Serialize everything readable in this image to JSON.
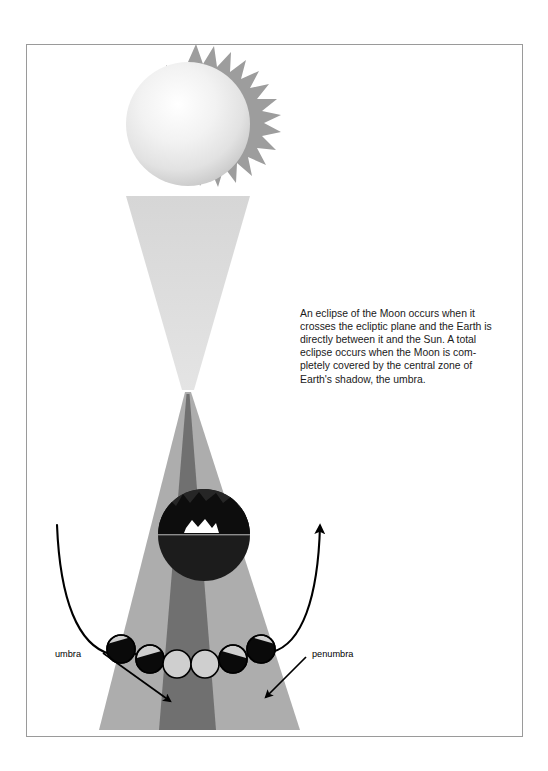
{
  "figure": {
    "name": "lunar-eclipse-diagram",
    "frame": {
      "border_color": "#9a9a9a",
      "background": "#ffffff"
    },
    "colors": {
      "sun_core": "#ffffff",
      "sun_edge": "#cfcfcf",
      "sun_corona": "#9d9d9d",
      "light_cone": "#dcdcdc",
      "penumbra": "#adadad",
      "umbra": "#707070",
      "earth_dark": "#1c1c1c",
      "earth_cloud": "#ffffff",
      "line": "#000000",
      "text": "#1a1a1a"
    },
    "sun": {
      "name": "sun",
      "label": "Sun"
    },
    "earth": {
      "name": "earth",
      "label": "Earth"
    },
    "caption": {
      "lines": [
        "An eclipse of the Moon occurs when it",
        "crosses the ecliptic plane and the Earth is",
        "directly between it and the Sun. A total",
        "eclipse occurs when the Moon is com-",
        "pletely covered by the central zone of",
        "Earth's shadow, the umbra."
      ],
      "full_text": "An eclipse of the Moon occurs when it crosses the ecliptic plane and the Earth is directly between it and the Sun. A total eclipse occurs when the Moon is completely covered by the central zone of Earth's shadow, the umbra."
    },
    "annotations": [
      {
        "name": "umbra-label",
        "text": "umbra",
        "x": 55,
        "y": 657
      },
      {
        "name": "penumbra-label",
        "text": "penumbra",
        "x": 312,
        "y": 657
      }
    ],
    "moon_phases": [
      {
        "name": "moon-1",
        "cx": 121,
        "cy": 649,
        "r": 14,
        "lit": "right-crescent",
        "shadow_fraction": 0.62
      },
      {
        "name": "moon-2",
        "cx": 150,
        "cy": 659,
        "r": 14,
        "lit": "right-half",
        "shadow_fraction": 0.45
      },
      {
        "name": "moon-3",
        "cx": 177,
        "cy": 664,
        "r": 14,
        "lit": "full",
        "shadow_fraction": 0.0
      },
      {
        "name": "moon-4",
        "cx": 205,
        "cy": 664,
        "r": 14,
        "lit": "full",
        "shadow_fraction": 0.0
      },
      {
        "name": "moon-5",
        "cx": 233,
        "cy": 659,
        "r": 14,
        "lit": "left-half",
        "shadow_fraction": 0.45
      },
      {
        "name": "moon-6",
        "cx": 261,
        "cy": 649,
        "r": 14,
        "lit": "left-crescent",
        "shadow_fraction": 0.62
      }
    ]
  }
}
